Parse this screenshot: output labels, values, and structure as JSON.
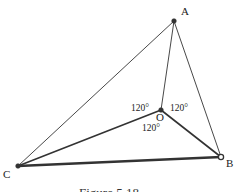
{
  "figure": {
    "caption": "Figure 5.18",
    "colors": {
      "line": "#333333",
      "point_fill": "#333333",
      "hollow_point_fill": "#ffffff"
    },
    "points": [
      {
        "id": "A",
        "label": "A",
        "style": "filled"
      },
      {
        "id": "B",
        "label": "B",
        "style": "hollow"
      },
      {
        "id": "C",
        "label": "C",
        "style": "filled"
      },
      {
        "id": "O",
        "label": "O",
        "style": "filled"
      }
    ],
    "segments": [
      {
        "from": "A",
        "to": "C",
        "weight": "thin"
      },
      {
        "from": "A",
        "to": "B",
        "weight": "thin"
      },
      {
        "from": "A",
        "to": "O",
        "weight": "thin"
      },
      {
        "from": "O",
        "to": "C",
        "weight": "medium"
      },
      {
        "from": "O",
        "to": "B",
        "weight": "medium"
      },
      {
        "from": "C",
        "to": "B",
        "weight": "thick"
      }
    ],
    "angles": [
      {
        "at": "O",
        "between": [
          "A",
          "C"
        ],
        "label": "120°"
      },
      {
        "at": "O",
        "between": [
          "A",
          "B"
        ],
        "label": "120°"
      },
      {
        "at": "O",
        "between": [
          "B",
          "C"
        ],
        "label": "120°"
      }
    ]
  }
}
